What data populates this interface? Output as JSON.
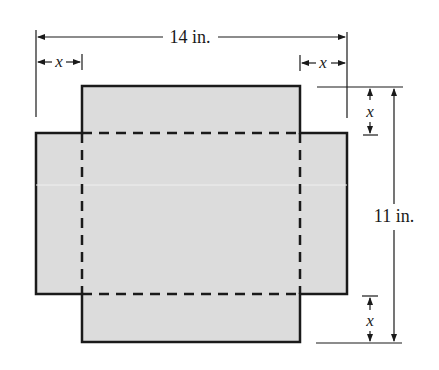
{
  "diagram": {
    "colors": {
      "fill": "#dcdcdc",
      "stroke": "#1a1a1a",
      "background": "#ffffff"
    },
    "labels": {
      "width": "14 in.",
      "height": "11 in.",
      "cut_top_left": "x",
      "cut_top_right": "x",
      "cut_right_top": "x",
      "cut_right_bottom": "x"
    },
    "dimensions": {
      "sheet_width_in": 14,
      "sheet_height_in": 11,
      "corner_cut": "x"
    }
  }
}
